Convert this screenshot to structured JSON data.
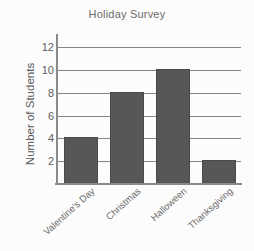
{
  "chart_data": {
    "type": "bar",
    "title": "Holiday Survey",
    "xlabel": "",
    "ylabel": "Number of Students",
    "categories": [
      "Valentine's Day",
      "Christmas",
      "Halloween",
      "Thanksgiving"
    ],
    "values": [
      4,
      8,
      10,
      2
    ],
    "ylim": [
      0,
      13
    ],
    "yticks": [
      2,
      4,
      6,
      8,
      10,
      12
    ],
    "ytick_labels": [
      "2",
      "4",
      "6",
      "8",
      "10",
      "12"
    ],
    "grid": "horizontal",
    "legend": "none",
    "bar_color": "#575757",
    "axis_color": "#8a8a8a",
    "text_color": "#6b6b6b",
    "background_color": "#fcfcfc"
  }
}
